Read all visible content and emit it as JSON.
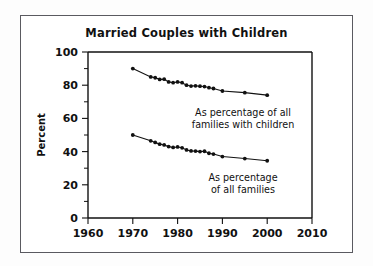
{
  "figure": {
    "title": "Married Couples with Children",
    "border_color": "#5a5a60",
    "background": "#ffffff",
    "ink_color": "#111111"
  },
  "chart_data": {
    "type": "line",
    "title": "Married Couples with Children",
    "xlabel": "",
    "ylabel": "Percent",
    "xlim": [
      1960,
      2010
    ],
    "ylim": [
      0,
      100
    ],
    "xticks": [
      1960,
      1970,
      1980,
      1990,
      2000,
      2010
    ],
    "xtick_labels": [
      "1960",
      "1970",
      "1980",
      "1990",
      "2000",
      "2010"
    ],
    "yticks": [
      0,
      20,
      40,
      60,
      80,
      100
    ],
    "ytick_labels": [
      "0",
      "20",
      "40",
      "60",
      "80",
      "100"
    ],
    "yticks_minor": [
      10,
      30,
      50,
      70,
      90
    ],
    "grid": false,
    "legend_position": "inline-annotations",
    "series": [
      {
        "name": "As percentage of all families with children",
        "marker": "filled-circle",
        "x": [
          1970,
          1974,
          1975,
          1976,
          1977,
          1978,
          1979,
          1980,
          1981,
          1982,
          1983,
          1984,
          1985,
          1986,
          1987,
          1988,
          1990,
          1995,
          2000
        ],
        "values": [
          90.0,
          85.0,
          84.5,
          83.5,
          83.6,
          82.0,
          81.5,
          82.0,
          81.5,
          80.0,
          79.5,
          79.6,
          79.4,
          79.2,
          78.5,
          78.0,
          76.5,
          75.5,
          74.0
        ]
      },
      {
        "name": "As percentage of all families",
        "marker": "filled-circle",
        "x": [
          1970,
          1974,
          1975,
          1976,
          1977,
          1978,
          1979,
          1980,
          1981,
          1982,
          1983,
          1984,
          1985,
          1986,
          1987,
          1988,
          1990,
          1995,
          2000
        ],
        "values": [
          50.0,
          46.5,
          45.5,
          44.5,
          44.0,
          43.0,
          42.5,
          42.8,
          42.3,
          41.0,
          40.4,
          40.3,
          40.0,
          40.2,
          39.0,
          38.5,
          37.0,
          35.8,
          34.5
        ]
      }
    ],
    "annotations": [
      {
        "id": "upper-series-annotation",
        "lines": [
          "As percentage of all",
          "families with children"
        ],
        "x": 1989,
        "y": 63
      },
      {
        "id": "lower-series-annotation",
        "lines": [
          "As percentage",
          "of all families"
        ],
        "x": 1989,
        "y": 27
      }
    ]
  }
}
